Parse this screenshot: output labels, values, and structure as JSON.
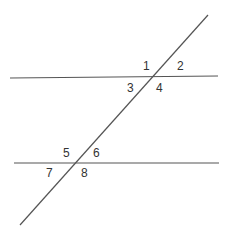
{
  "diagram": {
    "type": "parallel-lines-transversal",
    "line_color": "#555555",
    "label_color": "#333333",
    "lines": [
      {
        "name": "upper-parallel-line",
        "x1": 10,
        "y1": 78,
        "x2": 218,
        "y2": 76
      },
      {
        "name": "lower-parallel-line",
        "x1": 14,
        "y1": 163,
        "x2": 219,
        "y2": 163
      },
      {
        "name": "transversal-line",
        "x1": 208,
        "y1": 15,
        "x2": 20,
        "y2": 225
      }
    ],
    "angle_labels": [
      {
        "text": "1",
        "x": 143,
        "y": 70
      },
      {
        "text": "2",
        "x": 177,
        "y": 70
      },
      {
        "text": "3",
        "x": 127,
        "y": 92
      },
      {
        "text": "4",
        "x": 156,
        "y": 92
      },
      {
        "text": "5",
        "x": 63,
        "y": 157
      },
      {
        "text": "6",
        "x": 93,
        "y": 157
      },
      {
        "text": "7",
        "x": 46,
        "y": 177
      },
      {
        "text": "8",
        "x": 81,
        "y": 177
      }
    ]
  }
}
